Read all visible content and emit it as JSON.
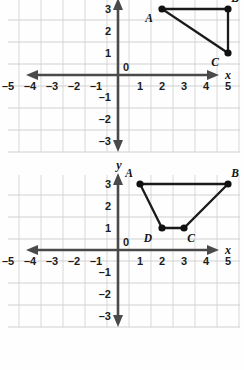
{
  "figure": {
    "grid_color": "#d8d8d8",
    "axis_color": "#4a4a4a",
    "shape_color": "#1a1a1a",
    "vertex_color": "#111111"
  },
  "chart_data": [
    {
      "type": "scatter",
      "name": "top-graph",
      "title": "",
      "xlabel": "x",
      "ylabel": "",
      "xlim": [
        -5.9,
        5.6
      ],
      "ylim": [
        -3.6,
        3.6
      ],
      "grid": true,
      "xticks": [
        -5,
        -4,
        -3,
        -2,
        -1,
        1,
        2,
        3,
        4,
        5
      ],
      "yticks": [
        3,
        2,
        1,
        -1,
        -2,
        -3
      ],
      "xticklabels": [
        "–5",
        "–4",
        "–3",
        "–2",
        "–1",
        "1",
        "2",
        "3",
        "4",
        "5"
      ],
      "yticklabels": [
        "3",
        "2",
        "1",
        "–1",
        "–2",
        "–3"
      ],
      "origin_label": "0",
      "points": [
        {
          "label": "A",
          "x": 2,
          "y": 3,
          "label_dx": -13,
          "label_dy": 13
        },
        {
          "label": "B",
          "x": 5,
          "y": 3,
          "label_dx": 7,
          "label_dy": -7
        },
        {
          "label": "C",
          "x": 5,
          "y": 1,
          "label_dx": -13,
          "label_dy": 13
        }
      ],
      "polygon": [
        "A",
        "B",
        "C"
      ],
      "closed": true
    },
    {
      "type": "scatter",
      "name": "bottom-graph",
      "title": "",
      "xlabel": "x",
      "ylabel": "y",
      "xlim": [
        -5.9,
        5.6
      ],
      "ylim": [
        -3.6,
        3.6
      ],
      "grid": true,
      "xticks": [
        -5,
        -4,
        -3,
        -2,
        -1,
        1,
        2,
        3,
        4,
        5
      ],
      "yticks": [
        3,
        2,
        1,
        -1,
        -2,
        -3
      ],
      "xticklabels": [
        "–5",
        "–4",
        "–3",
        "–2",
        "–1",
        "1",
        "2",
        "3",
        "4",
        "5"
      ],
      "yticklabels": [
        "3",
        "2",
        "1",
        "–1",
        "–2",
        "–3"
      ],
      "origin_label": "0",
      "points": [
        {
          "label": "A",
          "x": 1,
          "y": 3,
          "label_dx": -11,
          "label_dy": -7
        },
        {
          "label": "B",
          "x": 5,
          "y": 3,
          "label_dx": 7,
          "label_dy": -7
        },
        {
          "label": "C",
          "x": 3,
          "y": 1,
          "label_dx": 7,
          "label_dy": 14
        },
        {
          "label": "D",
          "x": 2,
          "y": 1,
          "label_dx": -14,
          "label_dy": 14
        }
      ],
      "polygon": [
        "A",
        "B",
        "C",
        "D"
      ],
      "closed": true
    }
  ]
}
